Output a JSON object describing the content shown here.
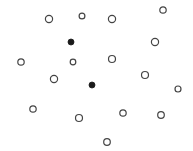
{
  "diagram": {
    "width": 193,
    "height": 151,
    "background": "#ffffff",
    "stroke_color": "#444444",
    "fill_color": "#1a1a1a",
    "points": [
      {
        "x": 49,
        "y": 19,
        "r": 3.6,
        "filled": false
      },
      {
        "x": 82,
        "y": 16,
        "r": 2.9,
        "filled": false
      },
      {
        "x": 112,
        "y": 19,
        "r": 3.6,
        "filled": false
      },
      {
        "x": 163,
        "y": 10,
        "r": 3.2,
        "filled": false
      },
      {
        "x": 71,
        "y": 42,
        "r": 3.0,
        "filled": true
      },
      {
        "x": 155,
        "y": 42,
        "r": 3.6,
        "filled": false
      },
      {
        "x": 21,
        "y": 62,
        "r": 3.2,
        "filled": false
      },
      {
        "x": 73,
        "y": 62,
        "r": 2.8,
        "filled": false
      },
      {
        "x": 112,
        "y": 59,
        "r": 3.5,
        "filled": false
      },
      {
        "x": 54,
        "y": 79,
        "r": 3.6,
        "filled": false
      },
      {
        "x": 145,
        "y": 75,
        "r": 3.5,
        "filled": false
      },
      {
        "x": 92,
        "y": 85,
        "r": 3.0,
        "filled": true
      },
      {
        "x": 178,
        "y": 89,
        "r": 3.0,
        "filled": false
      },
      {
        "x": 33,
        "y": 109,
        "r": 3.2,
        "filled": false
      },
      {
        "x": 79,
        "y": 118,
        "r": 3.5,
        "filled": false
      },
      {
        "x": 123,
        "y": 113,
        "r": 3.2,
        "filled": false
      },
      {
        "x": 161,
        "y": 115,
        "r": 3.3,
        "filled": false
      },
      {
        "x": 107,
        "y": 142,
        "r": 3.3,
        "filled": false
      }
    ]
  }
}
